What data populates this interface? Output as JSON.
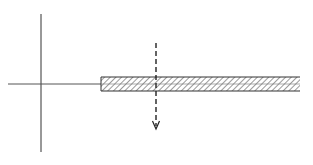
{
  "diagram": {
    "type": "mechanics-schematic",
    "colors": {
      "background": "#ffffff",
      "line": "#333333",
      "hatch": "#555555"
    },
    "axes": {
      "vertical": {
        "x": 41,
        "y1": 14,
        "y2": 152
      },
      "horizontal": {
        "x1": 8,
        "x2": 101,
        "y": 84
      }
    },
    "bar": {
      "x": 101,
      "y": 77,
      "width": 199,
      "height": 14,
      "fill": "hatched",
      "centerline": true
    },
    "force_line": {
      "style": "dashed",
      "x": 156,
      "y1": 43,
      "y2": 128,
      "arrow": "down"
    }
  }
}
